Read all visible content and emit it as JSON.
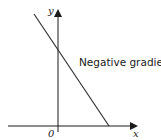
{
  "diagram": {
    "type": "line-graph-sketch",
    "annotation": "Negative gradient",
    "axes": {
      "x_label": "x",
      "y_label": "y",
      "origin_label": "0"
    },
    "line": {
      "description": "straight line with negative gradient",
      "y_intercept": "positive",
      "x_intercept": "positive"
    },
    "colors": {
      "line": "#333333",
      "axes": "#1a1a1a",
      "background": "#ffffff"
    }
  }
}
